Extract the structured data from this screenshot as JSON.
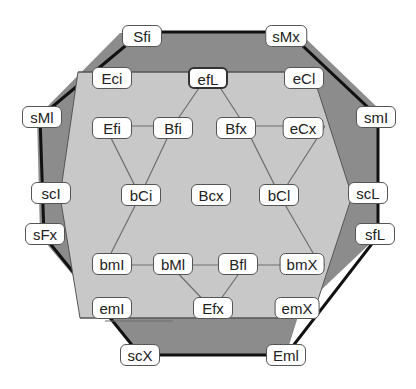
{
  "colors": {
    "outer_fill": "#8c8c8c",
    "inner_fill": "#c8c8c8",
    "outer_stroke": "#111111",
    "edge_stroke": "#6e6e6e"
  },
  "nodes": {
    "Sfi": "Sfi",
    "sMx": "sMx",
    "sMl": "sMl",
    "smI": "smI",
    "scI": "scI",
    "scL": "scL",
    "sFx": "sFx",
    "sfL": "sfL",
    "scX": "scX",
    "Eml": "Eml",
    "Eci": "Eci",
    "efL": "efL",
    "eCl": "eCl",
    "Efi": "Efi",
    "Bfi": "Bfi",
    "Bfx": "Bfx",
    "eCx": "eCx",
    "bCi": "bCi",
    "Bcx": "Bcx",
    "bCl": "bCl",
    "bmI": "bmI",
    "bMl": "bMl",
    "Bfl": "Bfl",
    "bmX": "bmX",
    "emI": "emI",
    "Efx": "Efx",
    "emX": "emX"
  }
}
